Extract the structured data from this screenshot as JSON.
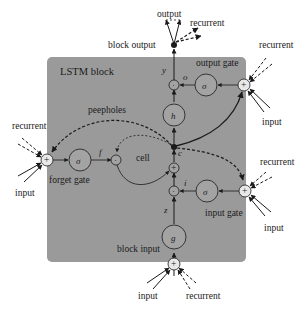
{
  "diagram": {
    "block_title": "LSTM block",
    "colors": {
      "block_fill": "#9a9a9a",
      "stroke": "#1a1a1a",
      "node_fill": "#a3a3a3",
      "background": "#ffffff"
    },
    "labels": {
      "output": "output",
      "recurrent_top": "recurrent",
      "block_output": "block output",
      "output_gate": "output gate",
      "recurrent_og": "recurrent",
      "input_og": "input",
      "peepholes": "peepholes",
      "recurrent_fg": "recurrent",
      "input_fg": "input",
      "forget_gate": "forget gate",
      "cell": "cell",
      "recurrent_ig": "recurrent",
      "input_ig": "input",
      "input_gate": "input gate",
      "block_input": "block input",
      "input_bottom": "input",
      "recurrent_bottom": "recurrent"
    },
    "variables": {
      "y": "y",
      "o": "o",
      "f": "f",
      "c": "c",
      "i": "i",
      "z": "z"
    },
    "nodes": {
      "output_gate_activation": "σ",
      "forget_gate_activation": "σ",
      "input_gate_activation": "σ",
      "output_activation": "h",
      "input_activation": "g",
      "sum": "+",
      "multiply": "·"
    }
  }
}
